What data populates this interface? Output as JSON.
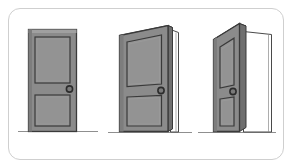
{
  "figure": {
    "background_color": "#ffffff",
    "border_color": "#cfcfcf",
    "canvas": {
      "width": 292,
      "height": 168
    }
  },
  "palette": {
    "door_face": "#8b8b8b",
    "panel_fill": "#939393",
    "door_edge_dark": "#6f6f6f",
    "door_top_edge": "#5f5f5f",
    "outline": "#3a3a3a",
    "frame_line": "#4a4a4a",
    "floor_line": "#8f8f8f",
    "knob_ring": "#2c2c2c",
    "knob_center": "#7a7a7a",
    "opening_fill": "#ffffff"
  },
  "doors": [
    {
      "id": "door-closed",
      "label": "Closed door",
      "open_angle_deg": 0,
      "state": "closed",
      "panels": 2,
      "knob_side": "right",
      "shows_door_frame": false,
      "floor_line": true
    },
    {
      "id": "door-ajar",
      "label": "Partially open door",
      "open_angle_deg": 25,
      "state": "ajar",
      "panels": 2,
      "knob_side": "right",
      "shows_door_frame": true,
      "floor_line": true
    },
    {
      "id": "door-open",
      "label": "Wide open door",
      "open_angle_deg": 55,
      "state": "open",
      "panels": 2,
      "knob_side": "right",
      "shows_door_frame": true,
      "floor_line": true
    }
  ]
}
